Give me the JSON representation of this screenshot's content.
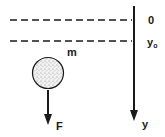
{
  "diagram": {
    "title": "",
    "colors": {
      "ink": "#1a1a1a",
      "ball_fill": "#d9d9d9",
      "background": "#ffffff"
    },
    "reference_lines": [
      {
        "id": "origin",
        "label": "0",
        "style": "dashed"
      },
      {
        "id": "initial",
        "label": "y",
        "subscript": "o",
        "style": "dashed"
      }
    ],
    "axis": {
      "label": "y",
      "direction": "down"
    },
    "mass": {
      "label": "m",
      "shape": "circle",
      "fill": "stippled"
    },
    "force": {
      "label": "F",
      "direction": "down"
    }
  }
}
